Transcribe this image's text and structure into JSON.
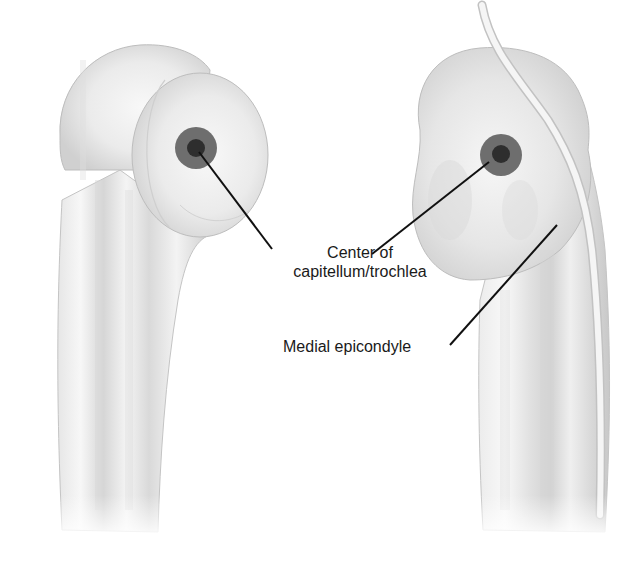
{
  "figure": {
    "views": [
      {
        "id": "lateral-view",
        "position": "left"
      },
      {
        "id": "medial-view",
        "position": "right"
      }
    ],
    "labels": {
      "center": {
        "line1": "Center of",
        "line2": "capitellum/trochlea"
      },
      "medial_epicondyle": "Medial epicondyle"
    },
    "colors": {
      "bone_light": "#f2f2f2",
      "bone_shade": "#cfcfcf",
      "bone_outline": "#b8b8b8",
      "target_outer": "#6e6e6e",
      "target_inner": "#2e2e2e",
      "leader_line": "#111111",
      "text": "#1a1a1a"
    }
  }
}
